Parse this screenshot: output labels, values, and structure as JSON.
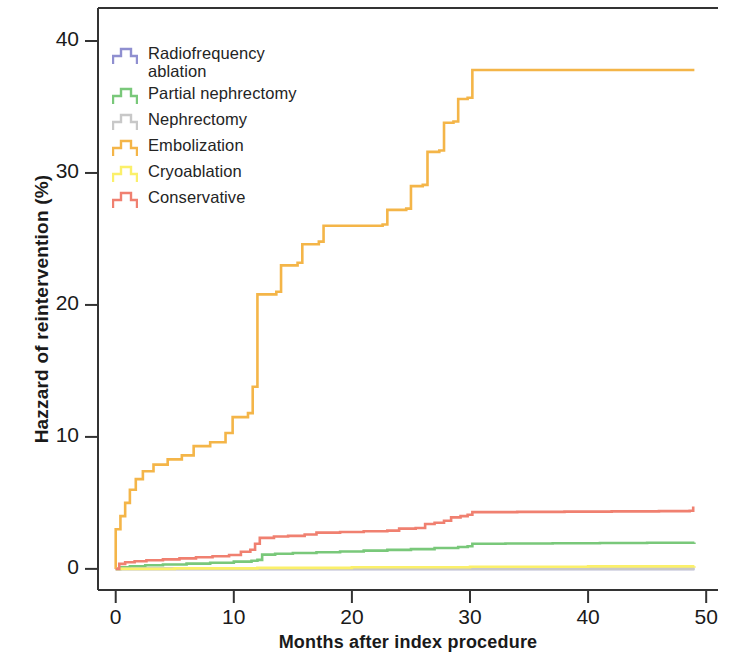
{
  "figure": {
    "background": "#ffffff",
    "axis_color": "#333333"
  },
  "chart_data": {
    "type": "line",
    "title": "",
    "subtitle": "",
    "xlabel": "Months after index procedure",
    "ylabel": "Hazzard of reintervention (%)",
    "xlim": [
      -1.5,
      51
    ],
    "ylim": [
      -1.6,
      42.5
    ],
    "xticks": [
      0,
      10,
      20,
      30,
      40,
      50
    ],
    "xtick_labels": [
      "0",
      "10",
      "20",
      "30",
      "40",
      "50"
    ],
    "yticks": [
      0,
      10,
      20,
      30,
      40
    ],
    "ytick_labels": [
      "0",
      "10",
      "20",
      "30",
      "40"
    ],
    "grid": false,
    "legend_position": "upper-left-inside",
    "step_style": "post",
    "series": [
      {
        "name": "Radiofrequency ablation",
        "color": "#8f8fd0",
        "points": [
          [
            0,
            0
          ],
          [
            49,
            0
          ]
        ]
      },
      {
        "name": "Partial nephrectomy",
        "color": "#79c87a",
        "points": [
          [
            0,
            0
          ],
          [
            0.4,
            0.12
          ],
          [
            1.2,
            0.2
          ],
          [
            2.5,
            0.27
          ],
          [
            4,
            0.33
          ],
          [
            6,
            0.4
          ],
          [
            8,
            0.47
          ],
          [
            10,
            0.55
          ],
          [
            11.5,
            0.62
          ],
          [
            12,
            0.68
          ],
          [
            12.4,
            1.08
          ],
          [
            13.5,
            1.15
          ],
          [
            15,
            1.2
          ],
          [
            17,
            1.26
          ],
          [
            19,
            1.32
          ],
          [
            21,
            1.38
          ],
          [
            23,
            1.44
          ],
          [
            25,
            1.5
          ],
          [
            27,
            1.58
          ],
          [
            29,
            1.66
          ],
          [
            29.8,
            1.72
          ],
          [
            30.2,
            1.9
          ],
          [
            33,
            1.92
          ],
          [
            37,
            1.94
          ],
          [
            41,
            1.96
          ],
          [
            45,
            1.98
          ],
          [
            49,
            2.0
          ]
        ]
      },
      {
        "name": "Nephrectomy",
        "color": "#c8c8c8",
        "points": [
          [
            0,
            0
          ],
          [
            49,
            0
          ]
        ]
      },
      {
        "name": "Embolization",
        "color": "#f4b548",
        "points": [
          [
            0,
            0
          ],
          [
            0,
            3.0
          ],
          [
            0.4,
            4.0
          ],
          [
            0.8,
            5.0
          ],
          [
            1.2,
            6.0
          ],
          [
            1.7,
            6.8
          ],
          [
            2.3,
            7.4
          ],
          [
            3.2,
            7.9
          ],
          [
            4.4,
            8.3
          ],
          [
            5.6,
            8.6
          ],
          [
            6.6,
            9.3
          ],
          [
            8.0,
            9.6
          ],
          [
            9.3,
            10.3
          ],
          [
            9.9,
            11.5
          ],
          [
            11.2,
            11.8
          ],
          [
            11.6,
            13.8
          ],
          [
            12.0,
            20.8
          ],
          [
            13.6,
            21.0
          ],
          [
            14.0,
            23.0
          ],
          [
            15.4,
            23.2
          ],
          [
            15.8,
            24.6
          ],
          [
            17.2,
            24.8
          ],
          [
            17.6,
            26.0
          ],
          [
            22.6,
            26.1
          ],
          [
            23.0,
            27.2
          ],
          [
            24.6,
            27.3
          ],
          [
            25.0,
            29.0
          ],
          [
            26.0,
            29.1
          ],
          [
            26.4,
            31.6
          ],
          [
            27.4,
            31.7
          ],
          [
            27.8,
            33.8
          ],
          [
            28.6,
            33.9
          ],
          [
            29.0,
            35.6
          ],
          [
            29.8,
            35.7
          ],
          [
            30.2,
            37.8
          ],
          [
            35,
            37.8
          ],
          [
            40,
            37.8
          ],
          [
            45,
            37.8
          ],
          [
            49,
            37.8
          ]
        ]
      },
      {
        "name": "Cryoablation",
        "color": "#fbf06a",
        "points": [
          [
            0,
            0
          ],
          [
            5,
            0.04
          ],
          [
            12,
            0.08
          ],
          [
            20,
            0.12
          ],
          [
            30,
            0.16
          ],
          [
            40,
            0.19
          ],
          [
            49,
            0.2
          ]
        ]
      },
      {
        "name": "Conservative",
        "color": "#f08070",
        "points": [
          [
            0,
            0
          ],
          [
            0.3,
            0.38
          ],
          [
            0.8,
            0.5
          ],
          [
            1.6,
            0.58
          ],
          [
            2.6,
            0.65
          ],
          [
            4.0,
            0.72
          ],
          [
            5.4,
            0.8
          ],
          [
            6.8,
            0.88
          ],
          [
            8.2,
            0.96
          ],
          [
            9.6,
            1.05
          ],
          [
            10.6,
            1.3
          ],
          [
            11.4,
            1.45
          ],
          [
            11.8,
            1.9
          ],
          [
            12.2,
            2.35
          ],
          [
            13.4,
            2.45
          ],
          [
            14.6,
            2.5
          ],
          [
            16.0,
            2.6
          ],
          [
            17.0,
            2.75
          ],
          [
            19.0,
            2.8
          ],
          [
            21.0,
            2.85
          ],
          [
            23.0,
            2.9
          ],
          [
            24.0,
            3.05
          ],
          [
            25.4,
            3.1
          ],
          [
            26.2,
            3.4
          ],
          [
            27.0,
            3.5
          ],
          [
            27.8,
            3.65
          ],
          [
            28.4,
            3.9
          ],
          [
            29.2,
            4.0
          ],
          [
            29.8,
            4.1
          ],
          [
            30.2,
            4.3
          ],
          [
            34,
            4.32
          ],
          [
            38,
            4.34
          ],
          [
            42,
            4.36
          ],
          [
            46,
            4.38
          ],
          [
            48.6,
            4.4
          ],
          [
            48.9,
            4.72
          ]
        ]
      }
    ]
  },
  "legend": {
    "items": [
      {
        "label": "Radiofrequency\nablation",
        "color": "#8f8fd0"
      },
      {
        "label": "Partial nephrectomy",
        "color": "#79c87a"
      },
      {
        "label": "Nephrectomy",
        "color": "#c8c8c8"
      },
      {
        "label": "Embolization",
        "color": "#f4b548"
      },
      {
        "label": "Cryoablation",
        "color": "#fbf06a"
      },
      {
        "label": "Conservative",
        "color": "#f08070"
      }
    ]
  }
}
